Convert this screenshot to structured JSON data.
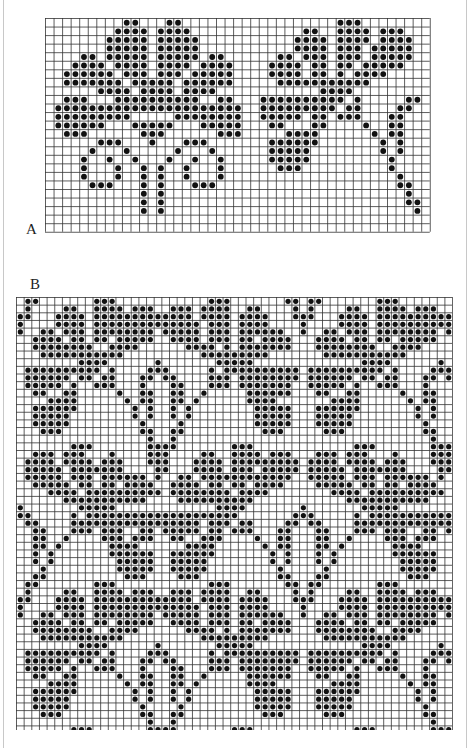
{
  "charts": {
    "A": {
      "label": "A",
      "cols": 45,
      "rows": 25,
      "dot_rows": [
        "9-10,14-15,34-36",
        "8-11,13-16,30-31,34-37,39-41",
        "7-11,13-17,29-32,34-37,39-42",
        "7-11,13-17,29-32,34-36,38-42",
        "4-5,7-11,13-17,19-20,27-28,30-32,34-36,38-42",
        "3-6,8-11,13-16,18-21,26-29,31-32,34-35,37-41",
        "2-7,9-11,13-15,17-21,26-29,31-32,34,36-39",
        "2-8,10-14,16-21,27-37",
        "6-9,11-14,16-19,32-35",
        "2-4,8-17,20-21,25-34,36,42-43",
        "1-22,25-33,35-36,41-42",
        "1-9,15-22,25-29,31-32,34-36,40-41",
        "1-6,10-14,18-22,26-27,31-32,37,40-41",
        "2-4,11-13,20-22,28-31,38,40-41",
        "6-8,12,16-18,26-31,39,41",
        "5,9,15,19,26-30,39,41",
        "4,7,10,14,17,20,26-30,40",
        "4,8,11,13,16,20,27-29,40",
        "4,8,11,13,16,20,41",
        "5-7,11,13,17-19,41-42",
        "11,13,42",
        "11,13,42-43",
        "11,13,43",
        "",
        ""
      ]
    },
    "B": {
      "label": "B",
      "cols": 57,
      "rows": 57,
      "repeat": 37,
      "tile_rows": [
        "1-2,10-12,25-27,35-36",
        "1,6-7,10-13,15-17,20-22,24-27,30-31,36",
        "0-1,5-8,10-22,24-27,29-32,36",
        "0,5-8,10-23,25-27,29-32",
        "0,3-4,6-8,10-17,19-23,25-27,29-34",
        "2-5,7-8,10-11,13-17,20-23,25-27,29-30,32-35",
        "2-9,12-15,22-25,27,29-35",
        "3-13,24-32",
        "8-11,18,26-30",
        "1-10,12,17-19,25,27-36",
        "1-6,8-9,11-12,16-17,19-20,25-27,29-36",
        "1-5,7,10-12,16,20-21,25-27,29-35",
        "2-3,6-7,13,16-17,20-21,24,30-35",
        "4-7,14,16-17,20-21,23,30-33",
        "2-7,15,17,20,22,31-35",
        "2-6,15,17,20,22,31-35",
        "2-6,16,21,31-35",
        "3-5,16-17,20-21,32-34",
        "17,20",
        "7-9,17-20,28-30",
        "2-4,6-8,12,17-19,24-25,28-31,33-35",
        "1-4,6-9,11-13,17-19,23-26,28-36",
        "1-5,7-13,18-19,23-26,28-30,32-36",
        "1-5,7-9,11-16,18,21-22,24-35",
        "2-6,8-9,11-12,14-17,20-23,25-26,28-29,31-34",
        "4-7,9-18,20-27,29-32",
        "6-16,21-30",
        "0,8-12,26-29",
        "0-1,7,9-28,36",
        "1-2,7-23,25-27,29-30,35-36",
        "2-3,7-9,11-13,16-17,19-23,25-26,28-30,34-35",
        "2-3,6,11-13,15-17,20-21,24-26,31,34-35",
        "2-3,5,12-15,22-25,32,34-35",
        "2,4,12-17,20-25,33,35",
        "2,4,13-17,20-24,33,35",
        "3,13-17,20-24,34",
        "2-3,14-16,21-23,34-35"
      ]
    }
  }
}
